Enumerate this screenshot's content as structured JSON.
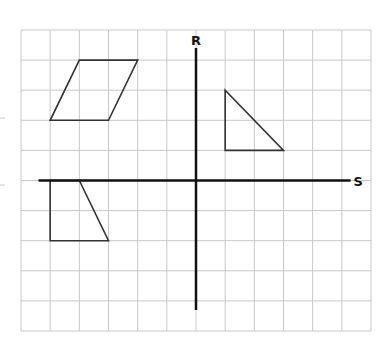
{
  "diagram": {
    "type": "coordinate-grid",
    "grid": {
      "columns": 12,
      "rows": 10,
      "origin_column": 6,
      "origin_row": 5,
      "line_color": "#c8c8c8"
    },
    "axes": {
      "vertical": {
        "label": "R",
        "from_units": -4.3,
        "to_units": 4.4
      },
      "horizontal": {
        "label": "S",
        "from_units": -5.4,
        "to_units": 5.3
      },
      "color": "#111111"
    },
    "shapes": [
      {
        "name": "parallelogram",
        "vertices": [
          [
            -4,
            4
          ],
          [
            -2,
            4
          ],
          [
            -3,
            2
          ],
          [
            -5,
            2
          ]
        ]
      },
      {
        "name": "right-triangle",
        "vertices": [
          [
            1,
            3
          ],
          [
            1,
            1
          ],
          [
            3,
            1
          ]
        ]
      },
      {
        "name": "trapezoid",
        "vertices": [
          [
            -5,
            0
          ],
          [
            -4,
            0
          ],
          [
            -3,
            -2
          ],
          [
            -5,
            -2
          ]
        ]
      }
    ],
    "shape_stroke": "#333333"
  }
}
